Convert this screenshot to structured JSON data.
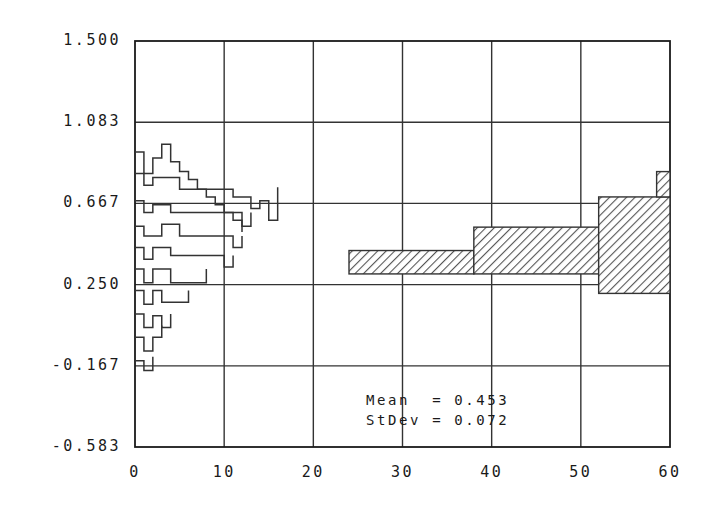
{
  "chart_data": {
    "type": "line",
    "title": "",
    "xlabel": "",
    "ylabel": "",
    "xlim": [
      0,
      60
    ],
    "ylim": [
      -0.583,
      1.5
    ],
    "grid": true,
    "legend": null,
    "x_ticks": [
      "0",
      "10",
      "20",
      "30",
      "40",
      "50",
      "60"
    ],
    "x_tick_values": [
      0,
      10,
      20,
      30,
      40,
      50,
      60
    ],
    "y_ticks": [
      "1.500",
      "1.083",
      "0.667",
      "0.250",
      "-0.167",
      "-0.583"
    ],
    "y_tick_values": [
      1.5,
      1.083,
      0.667,
      0.25,
      -0.167,
      -0.583
    ],
    "annotations": [
      {
        "name": "mean",
        "text": "Mean  = 0.453",
        "label": "Mean",
        "value": 0.453
      },
      {
        "name": "stdev",
        "text": "StDev = 0.072",
        "label": "StDev",
        "value": 0.072
      }
    ],
    "series": [
      {
        "name": "staircase-traces",
        "style": "step-outline",
        "fill": "none",
        "stroke": "#333333",
        "note": "overlapping stepped outline traces, x from 0 to 16",
        "paths": [
          {
            "x": [
              0,
              1,
              1,
              2,
              2,
              3,
              3,
              4,
              4,
              5,
              5,
              6,
              6,
              7,
              7,
              8,
              8,
              9,
              9,
              10,
              10,
              11,
              11,
              12,
              12
            ],
            "y": [
              0.93,
              0.93,
              0.82,
              0.82,
              0.9,
              0.9,
              0.97,
              0.97,
              0.88,
              0.88,
              0.83,
              0.83,
              0.79,
              0.79,
              0.74,
              0.74,
              0.7,
              0.7,
              0.66,
              0.66,
              0.62,
              0.62,
              0.58,
              0.58,
              0.52
            ]
          },
          {
            "x": [
              0,
              1,
              1,
              2,
              2,
              3,
              3,
              5,
              5,
              7,
              7,
              9,
              9,
              11,
              11,
              12,
              12,
              13,
              13,
              14,
              14,
              15,
              15,
              16,
              16
            ],
            "y": [
              0.82,
              0.82,
              0.76,
              0.76,
              0.8,
              0.8,
              0.8,
              0.8,
              0.74,
              0.74,
              0.74,
              0.74,
              0.74,
              0.74,
              0.7,
              0.7,
              0.7,
              0.7,
              0.64,
              0.64,
              0.68,
              0.68,
              0.58,
              0.58,
              0.75
            ]
          },
          {
            "x": [
              0,
              1,
              1,
              2,
              2,
              4,
              4,
              6,
              6,
              8,
              8,
              10,
              10,
              12,
              12,
              13,
              13
            ],
            "y": [
              0.68,
              0.68,
              0.62,
              0.62,
              0.66,
              0.66,
              0.62,
              0.62,
              0.62,
              0.62,
              0.62,
              0.62,
              0.62,
              0.62,
              0.55,
              0.55,
              0.62
            ]
          },
          {
            "x": [
              0,
              1,
              1,
              3,
              3,
              5,
              5,
              8,
              8,
              11,
              11,
              12,
              12
            ],
            "y": [
              0.55,
              0.55,
              0.5,
              0.5,
              0.56,
              0.56,
              0.5,
              0.5,
              0.5,
              0.5,
              0.44,
              0.44,
              0.5
            ]
          },
          {
            "x": [
              0,
              1,
              1,
              2,
              2,
              4,
              4,
              7,
              7,
              10,
              10,
              11,
              11
            ],
            "y": [
              0.44,
              0.44,
              0.38,
              0.38,
              0.44,
              0.44,
              0.4,
              0.4,
              0.4,
              0.4,
              0.34,
              0.34,
              0.4
            ]
          },
          {
            "x": [
              0,
              1,
              1,
              2,
              2,
              4,
              4,
              6,
              6,
              8,
              8
            ],
            "y": [
              0.33,
              0.33,
              0.26,
              0.26,
              0.33,
              0.33,
              0.26,
              0.26,
              0.26,
              0.26,
              0.33
            ]
          },
          {
            "x": [
              0,
              1,
              1,
              2,
              2,
              3,
              3,
              5,
              5,
              6,
              6
            ],
            "y": [
              0.22,
              0.22,
              0.15,
              0.15,
              0.22,
              0.22,
              0.16,
              0.16,
              0.16,
              0.16,
              0.22
            ]
          },
          {
            "x": [
              0,
              1,
              1,
              2,
              2,
              3,
              3,
              4,
              4
            ],
            "y": [
              0.1,
              0.1,
              0.03,
              0.03,
              0.09,
              0.09,
              0.03,
              0.03,
              0.1
            ]
          },
          {
            "x": [
              0,
              1,
              1,
              2,
              2,
              3,
              3
            ],
            "y": [
              -0.02,
              -0.02,
              -0.09,
              -0.09,
              -0.02,
              -0.02,
              0.04
            ]
          },
          {
            "x": [
              0,
              1,
              1,
              2,
              2
            ],
            "y": [
              -0.14,
              -0.14,
              -0.19,
              -0.19,
              -0.12
            ]
          }
        ]
      },
      {
        "name": "hatched-band",
        "style": "hatched-step-band",
        "fill": "hatch-45",
        "stroke": "#333333",
        "note": "stepped confidence band from x=24 to x=60",
        "steps": [
          {
            "x_start": 24,
            "x_end": 38,
            "y_low": 0.305,
            "y_high": 0.425
          },
          {
            "x_start": 38,
            "x_end": 52,
            "y_low": 0.305,
            "y_high": 0.545
          },
          {
            "x_start": 52,
            "x_end": 60,
            "y_low": 0.205,
            "y_high": 0.7
          },
          {
            "x_start": 58.5,
            "x_end": 60,
            "y_low": 0.7,
            "y_high": 0.83
          }
        ]
      }
    ]
  },
  "colors": {
    "axis": "#1a1a1a",
    "grid": "#333333",
    "trace": "#333333",
    "hatch": "#555555",
    "background": "#ffffff"
  }
}
